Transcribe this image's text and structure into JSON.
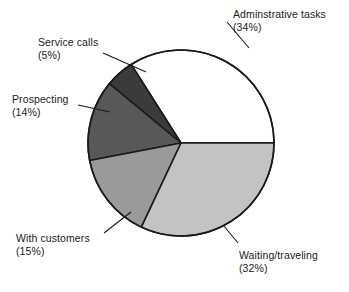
{
  "chart_data": {
    "type": "pie",
    "title": "",
    "subtitle": "",
    "xlabel": "",
    "ylabel": "",
    "legend_position": "none",
    "grid": false,
    "labels_inline": true,
    "units": "percent",
    "total": 100,
    "categories": [
      "Adminstrative tasks",
      "Waiting/traveling",
      "With customers",
      "Prospecting",
      "Service calls"
    ],
    "values": [
      34,
      32,
      15,
      14,
      5
    ],
    "slices": [
      {
        "name": "Adminstrative tasks",
        "label": "Adminstrative tasks",
        "percent_text": "(34%)",
        "value": 34,
        "color": "#ffffff",
        "start_deg": 0,
        "end_deg": 122.4,
        "leader": true
      },
      {
        "name": "Service calls",
        "label": "Service calls",
        "percent_text": "(5%)",
        "value": 5,
        "color": "#3b3b3b",
        "start_deg": 122.4,
        "end_deg": 140.4,
        "leader": true
      },
      {
        "name": "Prospecting",
        "label": "Prospecting",
        "percent_text": "(14%)",
        "value": 14,
        "color": "#585858",
        "start_deg": 140.4,
        "end_deg": 190.8,
        "leader": true
      },
      {
        "name": "With customers",
        "label": "With customers",
        "percent_text": "(15%)",
        "value": 15,
        "color": "#9a9a9a",
        "start_deg": 190.8,
        "end_deg": 244.8,
        "leader": true
      },
      {
        "name": "Waiting/traveling",
        "label": "Waiting/traveling",
        "percent_text": "(32%)",
        "value": 32,
        "color": "#c3c3c3",
        "start_deg": 244.8,
        "end_deg": 360,
        "leader": true
      }
    ],
    "geometry": {
      "center_x": 181,
      "center_y": 143,
      "radius": 93,
      "direction": "counterclockwise",
      "start_angle_deg": 0
    },
    "style": {
      "background": "#ffffff",
      "outline_color": "#1a1a1a",
      "outline_width": 1.6,
      "text_color": "#1a1a1a",
      "leader_color": "#1a1a1a"
    }
  },
  "labels": {
    "admin": {
      "name": "Adminstrative tasks",
      "pct": "(34%)"
    },
    "service": {
      "name": "Service calls",
      "pct": "(5%)"
    },
    "prospect": {
      "name": "Prospecting",
      "pct": "(14%)"
    },
    "customers": {
      "name": "With customers",
      "pct": "(15%)"
    },
    "waiting": {
      "name": "Waiting/traveling",
      "pct": "(32%)"
    }
  }
}
